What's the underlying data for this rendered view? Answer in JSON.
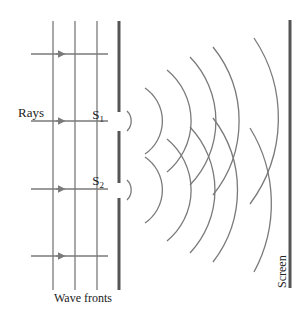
{
  "diagram": {
    "type": "double-slit-interference",
    "labels": {
      "rays": "Rays",
      "slit1": "S",
      "slit1_sub": "1",
      "slit2": "S",
      "slit2_sub": "2",
      "wave_fronts": "Wave fronts",
      "screen": "Screen"
    },
    "colors": {
      "line": "#7a7a7a",
      "barrier": "#555555",
      "text": "#222222",
      "background": "#ffffff"
    },
    "incident_wavefronts_x": [
      53,
      75,
      97
    ],
    "ray_y": [
      54,
      121,
      189,
      256
    ],
    "barrier_x": 119,
    "slit1_center_y": 121,
    "slit2_center_y": 190,
    "screen_x": 290,
    "arc_radii": [
      14,
      40,
      66,
      92,
      118,
      144
    ]
  }
}
